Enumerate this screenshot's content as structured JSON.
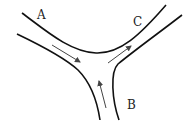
{
  "diagram": {
    "type": "road-junction",
    "labels": {
      "a": "A",
      "b": "B",
      "c": "C"
    },
    "colors": {
      "road_edge": "#111111",
      "arrow": "#444444",
      "background": "#ffffff"
    }
  }
}
